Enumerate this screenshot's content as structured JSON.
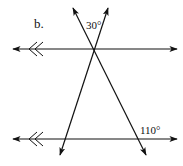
{
  "diagram": {
    "part_label": "b.",
    "angles": [
      {
        "id": "top-angle",
        "value": "30°"
      },
      {
        "id": "bottom-right-angle",
        "value": "110°"
      }
    ],
    "lines": {
      "parallel_top": "parallel line with double-chevron marker",
      "parallel_bottom": "parallel line with double-chevron marker",
      "transversal_1": "transversal through top intersection toward lower-left",
      "transversal_2": "transversal through top intersection toward lower-right"
    },
    "colors": {
      "stroke": "#111111",
      "background": "#ffffff"
    }
  }
}
